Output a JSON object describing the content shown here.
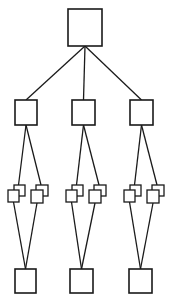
{
  "diagram": {
    "type": "tree",
    "colors": {
      "stroke": "#1a1a1a",
      "background": "#ffffff"
    },
    "root": {
      "id": "root",
      "x": 68,
      "y": 9,
      "w": 34,
      "h": 37
    },
    "branches": [
      {
        "id": "branch-left",
        "mid": {
          "x": 15,
          "y": 100,
          "w": 22,
          "h": 25
        },
        "pairs": [
          {
            "back": {
              "x": 14,
              "y": 185,
              "w": 11,
              "h": 11
            },
            "front": {
              "x": 8,
              "y": 190,
              "w": 11,
              "h": 12
            }
          },
          {
            "back": {
              "x": 36,
              "y": 185,
              "w": 12,
              "h": 11
            },
            "front": {
              "x": 31,
              "y": 190,
              "w": 12,
              "h": 13
            }
          }
        ],
        "leaf": {
          "x": 15,
          "y": 269,
          "w": 21,
          "h": 24
        }
      },
      {
        "id": "branch-center",
        "mid": {
          "x": 72,
          "y": 100,
          "w": 23,
          "h": 25
        },
        "pairs": [
          {
            "back": {
              "x": 72,
              "y": 185,
              "w": 11,
              "h": 11
            },
            "front": {
              "x": 66,
              "y": 190,
              "w": 11,
              "h": 12
            }
          },
          {
            "back": {
              "x": 94,
              "y": 185,
              "w": 12,
              "h": 11
            },
            "front": {
              "x": 89,
              "y": 190,
              "w": 12,
              "h": 13
            }
          }
        ],
        "leaf": {
          "x": 70,
          "y": 269,
          "w": 23,
          "h": 24
        }
      },
      {
        "id": "branch-right",
        "mid": {
          "x": 130,
          "y": 100,
          "w": 23,
          "h": 25
        },
        "pairs": [
          {
            "back": {
              "x": 130,
              "y": 185,
              "w": 11,
              "h": 11
            },
            "front": {
              "x": 124,
              "y": 190,
              "w": 11,
              "h": 12
            }
          },
          {
            "back": {
              "x": 152,
              "y": 185,
              "w": 12,
              "h": 11
            },
            "front": {
              "x": 147,
              "y": 190,
              "w": 12,
              "h": 13
            }
          }
        ],
        "leaf": {
          "x": 129,
          "y": 269,
          "w": 23,
          "h": 24
        }
      }
    ]
  }
}
